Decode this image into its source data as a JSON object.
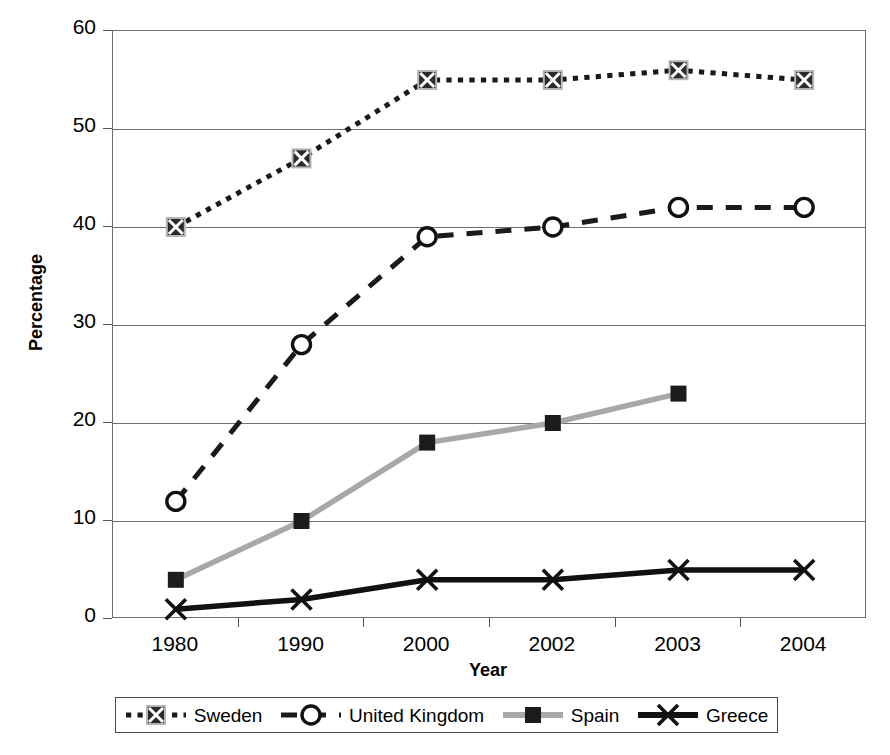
{
  "chart_data": {
    "type": "line",
    "title": "",
    "xlabel": "Year",
    "ylabel": "Percentage",
    "categories": [
      "1980",
      "1990",
      "2000",
      "2002",
      "2003",
      "2004"
    ],
    "ylim": [
      0,
      60
    ],
    "yticks": [
      0,
      10,
      20,
      30,
      40,
      50,
      60
    ],
    "grid": true,
    "legend_position": "bottom",
    "series": [
      {
        "name": "Sweden",
        "values": [
          40,
          47,
          55,
          55,
          56,
          55
        ],
        "marker": "crossed-square",
        "line_style": "dotted",
        "color": "#1a1a1a"
      },
      {
        "name": "United Kingdom",
        "values": [
          12,
          28,
          39,
          40,
          42,
          42
        ],
        "marker": "open-circle",
        "line_style": "dashed",
        "color": "#1a1a1a"
      },
      {
        "name": "Spain",
        "values": [
          4,
          10,
          18,
          20,
          23,
          null
        ],
        "marker": "filled-square",
        "line_style": "solid",
        "color": "#a8a8a8"
      },
      {
        "name": "Greece",
        "values": [
          1,
          2,
          4,
          4,
          5,
          5
        ],
        "marker": "cross-x",
        "line_style": "solid",
        "color": "#111111"
      }
    ]
  },
  "axis": {
    "y_title": "Percentage",
    "x_title": "Year",
    "y_tick_labels": [
      "0",
      "10",
      "20",
      "30",
      "40",
      "50",
      "60"
    ],
    "x_tick_labels": [
      "1980",
      "1990",
      "2000",
      "2002",
      "2003",
      "2004"
    ]
  },
  "legend": {
    "entries": [
      {
        "label": "Sweden"
      },
      {
        "label": "United Kingdom"
      },
      {
        "label": "Spain"
      },
      {
        "label": "Greece"
      }
    ]
  },
  "colors": {
    "axis": "#6e6e6e",
    "sweden": "#1a1a1a",
    "united_kingdom": "#1a1a1a",
    "spain": "#a8a8a8",
    "greece": "#111111",
    "background": "#ffffff"
  }
}
